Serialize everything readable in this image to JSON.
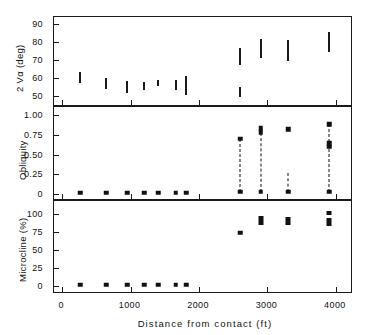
{
  "figure": {
    "background": "#ffffff",
    "ink": "#111111"
  },
  "axis_x": {
    "label": "Distance from contact  (ft)",
    "ticks": [
      0,
      1000,
      2000,
      3000,
      4000
    ],
    "tick_labels": [
      "0",
      "1000",
      "2000",
      "3000",
      "4000"
    ],
    "lim": [
      -120,
      4250
    ]
  },
  "panels": [
    {
      "key": "twov",
      "ylabel": "2 Vα (deg)",
      "ytick_labels": [
        "50",
        "60",
        "70",
        "80",
        "90"
      ],
      "yticks": [
        50,
        60,
        70,
        80,
        90
      ],
      "ylim": [
        45,
        94
      ]
    },
    {
      "key": "obliquity",
      "ylabel": "Obliquity",
      "ytick_labels": [
        "0",
        "0.25",
        "0.50",
        "0.75",
        "1.00"
      ],
      "yticks": [
        0,
        0.25,
        0.5,
        0.75,
        1.0
      ],
      "ylim": [
        -0.06,
        1.1
      ]
    },
    {
      "key": "microcline",
      "ylabel": "Microcline (%)",
      "ytick_labels": [
        "0",
        "25",
        "50",
        "75",
        "100"
      ],
      "yticks": [
        0,
        25,
        50,
        75,
        100
      ],
      "ylim": [
        -9,
        118
      ]
    }
  ],
  "chart_data": [
    {
      "type": "bar",
      "key": "twov",
      "title": "",
      "xlabel": "Distance from contact  (ft)",
      "ylabel": "2 Vα (deg)",
      "xlim": [
        -120,
        4250
      ],
      "ylim": [
        45,
        94
      ],
      "grid": false,
      "legend": "none",
      "orientation": "vertical-range-bars",
      "note": "Each vertical bar spans the measured minimum-to-maximum 2V-alpha range at one sample station.",
      "bars": [
        {
          "x": 260,
          "ymin": 57.0,
          "ymax": 63.5
        },
        {
          "x": 640,
          "ymin": 54.0,
          "ymax": 60.0
        },
        {
          "x": 950,
          "ymin": 51.5,
          "ymax": 58.5
        },
        {
          "x": 1200,
          "ymin": 53.5,
          "ymax": 58.0
        },
        {
          "x": 1400,
          "ymin": 55.5,
          "ymax": 59.0
        },
        {
          "x": 1660,
          "ymin": 53.5,
          "ymax": 59.0
        },
        {
          "x": 1810,
          "ymin": 50.5,
          "ymax": 61.0
        },
        {
          "x": 2600,
          "ymin": 67.5,
          "ymax": 77.0
        },
        {
          "x": 2600,
          "ymin": 49.5,
          "ymax": 55.0
        },
        {
          "x": 2900,
          "ymin": 71.0,
          "ymax": 82.0
        },
        {
          "x": 3300,
          "ymin": 69.5,
          "ymax": 81.0
        },
        {
          "x": 3900,
          "ymin": 74.5,
          "ymax": 85.5
        }
      ]
    },
    {
      "type": "scatter",
      "key": "obliquity",
      "title": "",
      "xlabel": "Distance from contact  (ft)",
      "ylabel": "Obliquity",
      "xlim": [
        -120,
        4250
      ],
      "ylim": [
        -0.06,
        1.1
      ],
      "grid": false,
      "legend": "none",
      "note": "Square markers; dashed vertical lines join the low and high obliquity values found at one station.",
      "points": [
        {
          "x": 260,
          "y": 0.02
        },
        {
          "x": 640,
          "y": 0.02
        },
        {
          "x": 950,
          "y": 0.02
        },
        {
          "x": 1200,
          "y": 0.02
        },
        {
          "x": 1400,
          "y": 0.02
        },
        {
          "x": 1660,
          "y": 0.02
        },
        {
          "x": 1810,
          "y": 0.02
        },
        {
          "x": 2600,
          "y": 0.7
        },
        {
          "x": 2600,
          "y": 0.03
        },
        {
          "x": 2900,
          "y": 0.83
        },
        {
          "x": 2900,
          "y": 0.78
        },
        {
          "x": 2900,
          "y": 0.03
        },
        {
          "x": 3300,
          "y": 0.82
        },
        {
          "x": 3300,
          "y": 0.03
        },
        {
          "x": 3900,
          "y": 0.88
        },
        {
          "x": 3900,
          "y": 0.64
        },
        {
          "x": 3900,
          "y": 0.6
        },
        {
          "x": 3900,
          "y": 0.03
        }
      ],
      "connectors": [
        {
          "x": 2600,
          "ylow": 0.03,
          "yhigh": 0.7
        },
        {
          "x": 2900,
          "ylow": 0.03,
          "yhigh": 0.83
        },
        {
          "x": 3300,
          "ylow": 0.03,
          "yhigh": 0.27
        },
        {
          "x": 3900,
          "ylow": 0.03,
          "yhigh": 0.88
        }
      ]
    },
    {
      "type": "scatter",
      "key": "microcline",
      "title": "",
      "xlabel": "Distance from contact  (ft)",
      "ylabel": "Microcline (%)",
      "xlim": [
        -120,
        4250
      ],
      "ylim": [
        -9,
        118
      ],
      "grid": false,
      "legend": "none",
      "note": "Filled squares; at the far stations several overlapping points merge into short vertical bars.",
      "points": [
        {
          "x": 260,
          "y": 1
        },
        {
          "x": 640,
          "y": 1
        },
        {
          "x": 950,
          "y": 1
        },
        {
          "x": 1200,
          "y": 1
        },
        {
          "x": 1400,
          "y": 1
        },
        {
          "x": 1660,
          "y": 1
        },
        {
          "x": 1810,
          "y": 1
        },
        {
          "x": 2600,
          "y": 74
        }
      ],
      "clusters": [
        {
          "x": 2900,
          "ymin": 84,
          "ymax": 97
        },
        {
          "x": 3300,
          "ymin": 84,
          "ymax": 96
        },
        {
          "x": 3900,
          "ymin": 99,
          "ymax": 104
        },
        {
          "x": 3900,
          "ymin": 83,
          "ymax": 94
        }
      ]
    }
  ]
}
